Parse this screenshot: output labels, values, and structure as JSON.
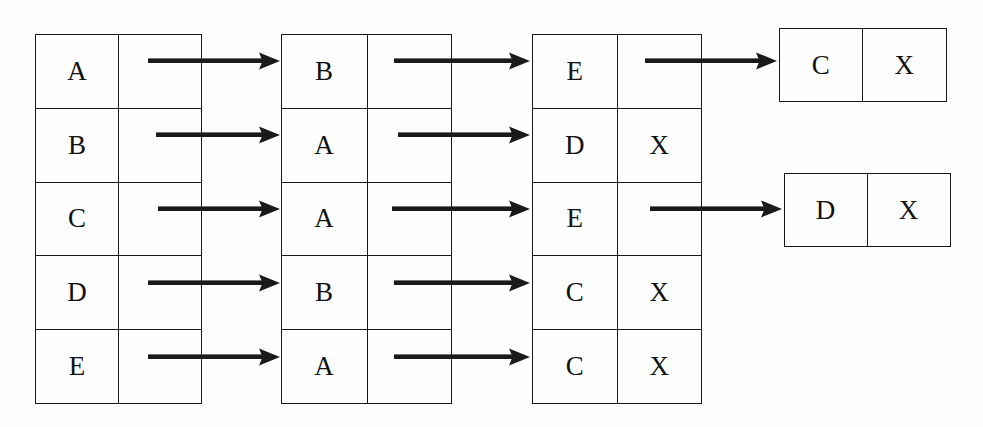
{
  "diagram": {
    "background_color": "#fefefe",
    "ink_color": "#1a1a1a",
    "tables": [
      {
        "name": "table-1",
        "x": 35,
        "y": 34,
        "width": 167,
        "height": 370,
        "rows": [
          {
            "key": "A",
            "value": ""
          },
          {
            "key": "B",
            "value": ""
          },
          {
            "key": "C",
            "value": ""
          },
          {
            "key": "D",
            "value": ""
          },
          {
            "key": "E",
            "value": ""
          }
        ]
      },
      {
        "name": "table-2",
        "x": 281,
        "y": 34,
        "width": 171,
        "height": 370,
        "rows": [
          {
            "key": "B",
            "value": ""
          },
          {
            "key": "A",
            "value": ""
          },
          {
            "key": "A",
            "value": ""
          },
          {
            "key": "B",
            "value": ""
          },
          {
            "key": "A",
            "value": ""
          }
        ]
      },
      {
        "name": "table-3",
        "x": 532,
        "y": 34,
        "width": 170,
        "height": 370,
        "rows": [
          {
            "key": "E",
            "value": ""
          },
          {
            "key": "D",
            "value": "X"
          },
          {
            "key": "E",
            "value": ""
          },
          {
            "key": "C",
            "value": "X"
          },
          {
            "key": "C",
            "value": "X"
          }
        ]
      }
    ],
    "boxes": [
      {
        "name": "box-c-x",
        "x": 779,
        "y": 28,
        "width": 168,
        "height": 74,
        "key": "C",
        "value": "X"
      },
      {
        "name": "box-d-x",
        "x": 784,
        "y": 173,
        "width": 167,
        "height": 74,
        "key": "D",
        "value": "X"
      }
    ],
    "arrows": [
      {
        "name": "arrow-t1r1-to-t2",
        "x": 148,
        "y": 61,
        "length": 132
      },
      {
        "name": "arrow-t1r2-to-t2",
        "x": 156,
        "y": 135,
        "length": 124
      },
      {
        "name": "arrow-t1r3-to-t2",
        "x": 158,
        "y": 209,
        "length": 122
      },
      {
        "name": "arrow-t1r4-to-t2",
        "x": 148,
        "y": 283,
        "length": 132
      },
      {
        "name": "arrow-t1r5-to-t2",
        "x": 148,
        "y": 357,
        "length": 132
      },
      {
        "name": "arrow-t2r1-to-t3",
        "x": 394,
        "y": 61,
        "length": 136
      },
      {
        "name": "arrow-t2r2-to-t3",
        "x": 398,
        "y": 135,
        "length": 132
      },
      {
        "name": "arrow-t2r3-to-t3",
        "x": 392,
        "y": 209,
        "length": 138
      },
      {
        "name": "arrow-t2r4-to-t3",
        "x": 394,
        "y": 283,
        "length": 136
      },
      {
        "name": "arrow-t2r5-to-t3",
        "x": 394,
        "y": 357,
        "length": 136
      },
      {
        "name": "arrow-t3r1-to-box-c-x",
        "x": 645,
        "y": 61,
        "length": 132
      },
      {
        "name": "arrow-t3r3-to-box-d-x",
        "x": 650,
        "y": 209,
        "length": 132
      }
    ]
  }
}
